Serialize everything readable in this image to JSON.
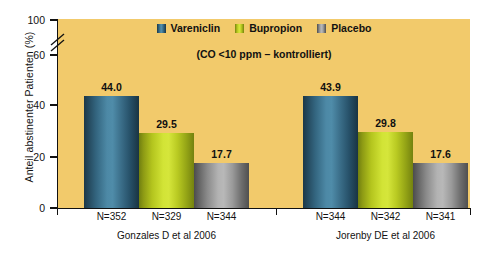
{
  "chart_data": {
    "type": "bar",
    "title": "",
    "subtitle": "(CO <10 ppm – kontrolliert)",
    "xlabel": "",
    "ylabel": "Anteil abstinenter Patienten (%)",
    "ylim": [
      0,
      100
    ],
    "yticks": [
      0,
      20,
      40,
      60,
      100
    ],
    "ytick_labels": [
      "0",
      "20",
      "40",
      "60",
      "100"
    ],
    "axis_break": {
      "between": [
        60,
        100
      ],
      "present": true
    },
    "grid": false,
    "legend_position": "top-center",
    "categories": [
      "Gonzales D et al 2006",
      "Jorenby DE et al 2006"
    ],
    "series": [
      {
        "name": "Vareniclin",
        "color": "#4d89a6",
        "values": [
          44.0,
          43.9
        ],
        "value_labels": [
          "44.0",
          "43.9"
        ],
        "n": [
          "N=352",
          "N=344"
        ]
      },
      {
        "name": "Bupropion",
        "color": "#d2e436",
        "values": [
          29.5,
          29.8
        ],
        "value_labels": [
          "29.5",
          "29.8"
        ],
        "n": [
          "N=329",
          "N=342"
        ]
      },
      {
        "name": "Placebo",
        "color": "#b3b3b3",
        "values": [
          17.7,
          17.6
        ],
        "value_labels": [
          "17.7",
          "17.6"
        ],
        "n": [
          "N=344",
          "N=341"
        ]
      }
    ],
    "plot_background": "#f2ca6b"
  },
  "legend": {
    "items": [
      {
        "label": "Vareniclin",
        "swatch": "legend-swatch-vareniclin"
      },
      {
        "label": "Bupropion",
        "swatch": "legend-swatch-bupropion"
      },
      {
        "label": "Placebo",
        "swatch": "legend-swatch-placebo"
      }
    ]
  }
}
